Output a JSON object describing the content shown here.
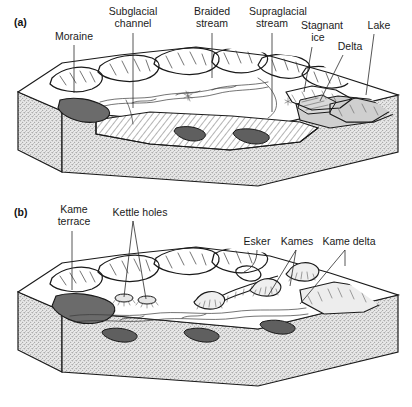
{
  "figure": {
    "background_color": "#ffffff",
    "ink_color": "#1a1a1a",
    "panels": [
      {
        "id": "a",
        "letter": "(a)",
        "caption_scene": "Active glacier margin block diagram",
        "labels": [
          {
            "key": "moraine",
            "text": "Moraine",
            "lines": [
              "Moraine"
            ],
            "x": 74,
            "y": 40,
            "anchor": "middle",
            "leader": {
              "type": "straight",
              "x1": 74,
              "y1": 45,
              "x2": 74,
              "y2": 93
            }
          },
          {
            "key": "subglacial-channel",
            "text": "Subglacial channel",
            "lines": [
              "Subglacial",
              "channel"
            ],
            "x": 133,
            "y": 15,
            "anchor": "middle",
            "leader": {
              "type": "straight",
              "x1": 133,
              "y1": 33,
              "x2": 133,
              "y2": 108
            }
          },
          {
            "key": "braided-stream",
            "text": "Braided stream",
            "lines": [
              "Braided",
              "stream"
            ],
            "x": 212,
            "y": 15,
            "anchor": "middle",
            "leader": {
              "type": "straight",
              "x1": 212,
              "y1": 33,
              "x2": 212,
              "y2": 78
            }
          },
          {
            "key": "supraglacial-stream",
            "text": "Supraglacial stream",
            "lines": [
              "Supraglacial",
              "stream"
            ],
            "x": 276,
            "y": 15,
            "anchor": "middle",
            "leader": {
              "type": "straight",
              "x1": 272,
              "y1": 33,
              "x2": 272,
              "y2": 112
            }
          },
          {
            "key": "stagnant-ice",
            "text": "Stagnant ice",
            "lines": [
              "Stagnant",
              "ice"
            ],
            "x": 322,
            "y": 29,
            "anchor": "middle",
            "leader": {
              "type": "straight",
              "x1": 312,
              "y1": 47,
              "x2": 304,
              "y2": 92
            }
          },
          {
            "key": "delta",
            "text": "Delta",
            "lines": [
              "Delta"
            ],
            "x": 350,
            "y": 50,
            "anchor": "middle",
            "leader": {
              "type": "straight",
              "x1": 343,
              "y1": 55,
              "x2": 320,
              "y2": 101
            }
          },
          {
            "key": "lake",
            "text": "Lake",
            "lines": [
              "Lake"
            ],
            "x": 379,
            "y": 29,
            "anchor": "middle",
            "leader": {
              "type": "straight",
              "x1": 374,
              "y1": 34,
              "x2": 366,
              "y2": 95
            }
          }
        ]
      },
      {
        "id": "b",
        "letter": "(b)",
        "caption_scene": "Post-glacial ice-contact landform block diagram",
        "labels": [
          {
            "key": "kame-terrace",
            "text": "Kame terrace",
            "lines": [
              "Kame",
              "terrace"
            ],
            "x": 74,
            "y": 213,
            "anchor": "middle",
            "leader": {
              "type": "straight",
              "x1": 72,
              "y1": 231,
              "x2": 72,
              "y2": 290
            }
          },
          {
            "key": "kettle-holes",
            "text": "Kettle holes",
            "lines": [
              "Kettle holes"
            ],
            "x": 140,
            "y": 216,
            "anchor": "middle",
            "leader": {
              "type": "fork",
              "x": 133,
              "y": 221,
              "targets": [
                [
                  124,
                  297
                ],
                [
                  146,
                  299
                ]
              ]
            }
          },
          {
            "key": "esker",
            "text": "Esker",
            "lines": [
              "Esker"
            ],
            "x": 257,
            "y": 245,
            "anchor": "middle",
            "leader": {
              "type": "curve",
              "d": "M257,250 C257,262 252,268 244,272"
            }
          },
          {
            "key": "kames",
            "text": "Kames",
            "lines": [
              "Kames"
            ],
            "x": 297,
            "y": 245,
            "anchor": "middle",
            "leader": {
              "type": "fork",
              "x": 296,
              "y": 250,
              "targets": [
                [
                  268,
                  296
                ],
                [
                  290,
                  286
                ]
              ]
            }
          },
          {
            "key": "kame-delta",
            "text": "Kame delta",
            "lines": [
              "Kame delta"
            ],
            "x": 349,
            "y": 245,
            "anchor": "middle",
            "leader": {
              "type": "fork",
              "x": 345,
              "y": 250,
              "targets": [
                [
                  345,
                  266
                ],
                [
                  300,
                  304
                ]
              ]
            }
          }
        ]
      }
    ],
    "legend_materials": [
      {
        "key": "bedrock-substrate",
        "name": "stippled substrate",
        "fill": "#dcdcdc"
      },
      {
        "key": "stagnant-ice-body",
        "name": "hatched buried ice",
        "fill": "#ffffff"
      },
      {
        "key": "moraine-deposit",
        "name": "dark moraine",
        "fill": "#6a6a6a"
      },
      {
        "key": "lake-water",
        "name": "light grey lake",
        "fill": "#cfcfcf"
      },
      {
        "key": "ice-surface",
        "name": "white glacier surface",
        "fill": "#ffffff"
      }
    ]
  }
}
